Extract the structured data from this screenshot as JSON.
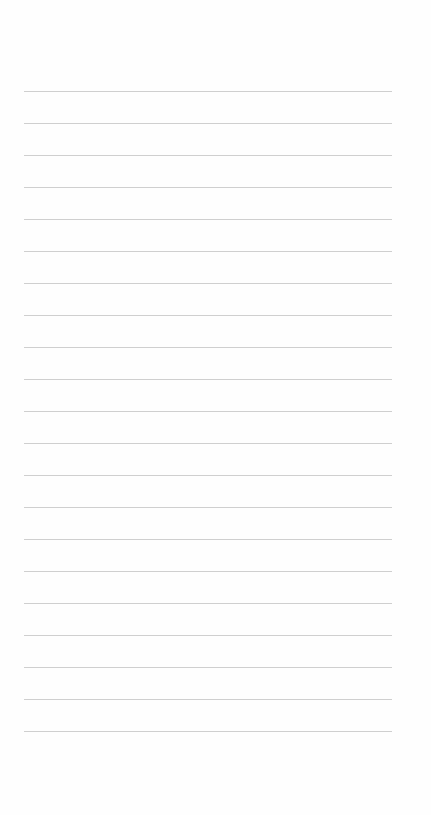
{
  "page": {
    "type": "lined-paper",
    "background": "#fefefe",
    "rule_color": "#cfcfcf",
    "rule_count": 21,
    "first_rule_y": 91,
    "rule_spacing": 32,
    "rule_left": 24,
    "rule_right": 392,
    "lines": [
      "",
      "",
      "",
      "",
      "",
      "",
      "",
      "",
      "",
      "",
      "",
      "",
      "",
      "",
      "",
      "",
      "",
      "",
      "",
      "",
      ""
    ]
  }
}
